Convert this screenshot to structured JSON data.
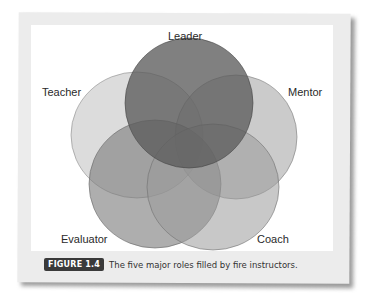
{
  "diagram": {
    "type": "venn",
    "sets": [
      {
        "name": "Leader",
        "shade": "#555555",
        "opacity": 0.85
      },
      {
        "name": "Teacher",
        "shade": "#bdbdbd",
        "opacity": 0.55
      },
      {
        "name": "Mentor",
        "shade": "#9e9e9e",
        "opacity": 0.6
      },
      {
        "name": "Evaluator",
        "shade": "#7a7a7a",
        "opacity": 0.6
      },
      {
        "name": "Coach",
        "shade": "#8a8a8a",
        "opacity": 0.55
      }
    ]
  },
  "labels": {
    "leader": "Leader",
    "teacher": "Teacher",
    "mentor": "Mentor",
    "evaluator": "Evaluator",
    "coach": "Coach"
  },
  "caption": {
    "figure_number": "FIGURE 1.4",
    "text": "The five major roles filled by fire instructors."
  }
}
